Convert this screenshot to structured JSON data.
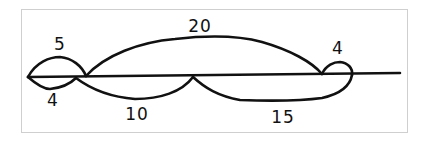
{
  "diagram": {
    "type": "hand-drawn number line with jump arcs",
    "line": {
      "x_start": 28,
      "x_end": 400,
      "y": 76
    },
    "points": [
      {
        "id": "A",
        "x": 28
      },
      {
        "id": "B",
        "x": 76
      },
      {
        "id": "C",
        "x": 193
      },
      {
        "id": "D",
        "x": 322
      },
      {
        "id": "E",
        "x": 352
      }
    ],
    "arcs": [
      {
        "id": "arc-5",
        "from": "A",
        "to": "B",
        "side": "above",
        "label": "5"
      },
      {
        "id": "arc-4-left",
        "from": "A",
        "to": "B",
        "side": "below",
        "label": "4"
      },
      {
        "id": "arc-20",
        "from": "B",
        "to": "D",
        "side": "above",
        "label": "20"
      },
      {
        "id": "arc-10",
        "from": "B",
        "to": "C",
        "side": "below",
        "label": "10"
      },
      {
        "id": "arc-15",
        "from": "C",
        "to": "E",
        "side": "below",
        "label": "15"
      },
      {
        "id": "arc-4-right",
        "from": "D",
        "to": "E",
        "side": "above",
        "label": "4"
      }
    ],
    "labels": {
      "arc5": "5",
      "arc4left": "4",
      "arc20": "20",
      "arc10": "10",
      "arc15": "15",
      "arc4right": "4"
    }
  }
}
